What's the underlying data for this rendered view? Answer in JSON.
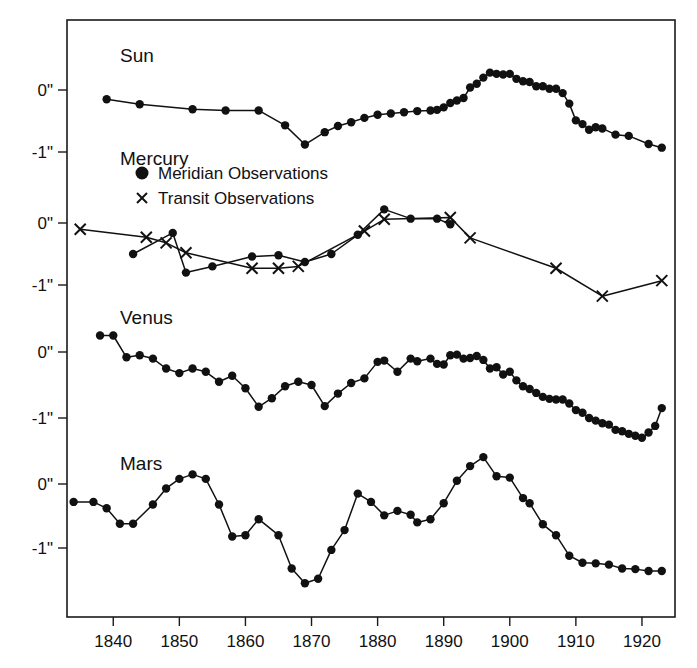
{
  "chart_data": {
    "type": "line",
    "title": "",
    "xlabel": "",
    "ylabel": "",
    "xlim": [
      1833,
      1925
    ],
    "grid": false,
    "legend_position": "inside-upper-left",
    "x_ticks": [
      1840,
      1850,
      1860,
      1870,
      1880,
      1890,
      1900,
      1910,
      1920
    ],
    "x_tick_labels": [
      "1840",
      "1850",
      "1860",
      "1870",
      "1880",
      "1890",
      "1900",
      "1910",
      "1920"
    ],
    "y_tick_labels": [
      "0\"",
      "-1\""
    ],
    "y_tick_values": [
      0,
      -1
    ],
    "legend": [
      {
        "label": "Meridian Observations",
        "marker": "filled-circle"
      },
      {
        "label": "Transit Observations",
        "marker": "cross-x"
      }
    ],
    "panels": [
      {
        "name": "Sun",
        "label": "Sun",
        "ylim": [
          -1.45,
          0.5
        ],
        "series": [
          {
            "name": "Sun meridian",
            "marker": "filled-circle",
            "x": [
              1839,
              1844,
              1852,
              1857,
              1862,
              1866,
              1869,
              1872,
              1874,
              1876,
              1878,
              1880,
              1882,
              1884,
              1886,
              1888,
              1889,
              1890,
              1891,
              1892,
              1893,
              1894,
              1895,
              1896,
              1897,
              1898,
              1899,
              1900,
              1901,
              1902,
              1903,
              1904,
              1905,
              1906,
              1907,
              1908,
              1909,
              1910,
              1911,
              1912,
              1913,
              1914,
              1916,
              1918,
              1921,
              1923
            ],
            "y": [
              -0.15,
              -0.23,
              -0.31,
              -0.33,
              -0.33,
              -0.57,
              -0.88,
              -0.68,
              -0.58,
              -0.52,
              -0.45,
              -0.4,
              -0.38,
              -0.36,
              -0.34,
              -0.33,
              -0.32,
              -0.28,
              -0.21,
              -0.17,
              -0.13,
              0.04,
              0.1,
              0.2,
              0.28,
              0.26,
              0.25,
              0.26,
              0.18,
              0.14,
              0.13,
              0.06,
              0.06,
              0.02,
              0.02,
              -0.05,
              -0.22,
              -0.49,
              -0.55,
              -0.64,
              -0.6,
              -0.62,
              -0.72,
              -0.74,
              -0.87,
              -0.93,
              -0.97,
              -1.02
            ]
          }
        ]
      },
      {
        "name": "Mercury",
        "label": "Mercury",
        "ylim": [
          -1.45,
          0.55
        ],
        "series": [
          {
            "name": "Mercury meridian",
            "marker": "filled-circle",
            "x": [
              1843,
              1849,
              1851,
              1855,
              1861,
              1865,
              1869,
              1873,
              1877,
              1881,
              1885,
              1889,
              1891
            ],
            "y": [
              -0.5,
              -0.16,
              -0.8,
              -0.7,
              -0.54,
              -0.52,
              -0.63,
              -0.5,
              -0.19,
              0.22,
              0.07,
              0.07,
              -0.02
            ]
          },
          {
            "name": "Mercury transit",
            "marker": "cross-x",
            "x": [
              1835,
              1845,
              1848,
              1851,
              1861,
              1865,
              1868,
              1878,
              1881,
              1891,
              1894,
              1907,
              1914,
              1923
            ],
            "y": [
              -0.1,
              -0.23,
              -0.32,
              -0.48,
              -0.73,
              -0.73,
              -0.7,
              -0.13,
              0.06,
              0.09,
              -0.24,
              -0.73,
              -1.18,
              -0.93
            ]
          }
        ]
      },
      {
        "name": "Venus",
        "label": "Venus",
        "ylim": [
          -1.55,
          0.5
        ],
        "series": [
          {
            "name": "Venus meridian",
            "marker": "filled-circle",
            "x": [
              1838,
              1840,
              1842,
              1844,
              1846,
              1848,
              1850,
              1852,
              1854,
              1856,
              1858,
              1860,
              1862,
              1864,
              1866,
              1868,
              1870,
              1872,
              1874,
              1876,
              1878,
              1880,
              1881,
              1883,
              1885,
              1886,
              1888,
              1889,
              1890,
              1891,
              1892,
              1893,
              1894,
              1895,
              1896,
              1897,
              1898,
              1899,
              1900,
              1901,
              1902,
              1903,
              1904,
              1905,
              1906,
              1907,
              1908,
              1909,
              1910,
              1911,
              1912,
              1913,
              1914,
              1915,
              1916,
              1917,
              1918,
              1919,
              1920,
              1921,
              1922,
              1923
            ],
            "y": [
              0.25,
              0.25,
              -0.08,
              -0.05,
              -0.1,
              -0.25,
              -0.32,
              -0.25,
              -0.3,
              -0.45,
              -0.36,
              -0.55,
              -0.83,
              -0.7,
              -0.52,
              -0.45,
              -0.5,
              -0.82,
              -0.63,
              -0.47,
              -0.4,
              -0.15,
              -0.13,
              -0.3,
              -0.1,
              -0.14,
              -0.1,
              -0.18,
              -0.19,
              -0.05,
              -0.04,
              -0.1,
              -0.09,
              -0.06,
              -0.12,
              -0.25,
              -0.23,
              -0.34,
              -0.3,
              -0.43,
              -0.52,
              -0.56,
              -0.62,
              -0.68,
              -0.71,
              -0.72,
              -0.72,
              -0.78,
              -0.88,
              -0.92,
              -1.0,
              -1.04,
              -1.08,
              -1.1,
              -1.18,
              -1.2,
              -1.24,
              -1.27,
              -1.3,
              -1.22,
              -1.12,
              -0.85
            ]
          }
        ]
      },
      {
        "name": "Mars",
        "label": "Mars",
        "ylim": [
          -1.75,
          0.5
        ],
        "series": [
          {
            "name": "Mars meridian",
            "marker": "filled-circle",
            "x": [
              1834,
              1837,
              1839,
              1841,
              1843,
              1846,
              1848,
              1850,
              1852,
              1854,
              1856,
              1858,
              1860,
              1862,
              1865,
              1867,
              1869,
              1871,
              1873,
              1875,
              1877,
              1879,
              1881,
              1883,
              1885,
              1886,
              1888,
              1890,
              1892,
              1894,
              1896,
              1898,
              1900,
              1902,
              1903,
              1905,
              1907,
              1909,
              1911,
              1913,
              1915,
              1917,
              1919,
              1921,
              1923
            ],
            "y": [
              -0.28,
              -0.28,
              -0.38,
              -0.62,
              -0.62,
              -0.32,
              -0.07,
              0.08,
              0.15,
              0.08,
              -0.32,
              -0.82,
              -0.8,
              -0.55,
              -0.8,
              -1.32,
              -1.55,
              -1.48,
              -1.03,
              -0.72,
              -0.15,
              -0.28,
              -0.49,
              -0.42,
              -0.48,
              -0.6,
              -0.55,
              -0.3,
              0.05,
              0.28,
              0.42,
              0.12,
              0.1,
              -0.22,
              -0.3,
              -0.63,
              -0.8,
              -1.12,
              -1.23,
              -1.24,
              -1.26,
              -1.32,
              -1.33,
              -1.36,
              -1.36
            ]
          }
        ]
      }
    ]
  },
  "panel_titles": {
    "sun": "Sun",
    "mercury": "Mercury",
    "venus": "Venus",
    "mars": "Mars"
  },
  "legend_labels": {
    "meridian": "Meridian Observations",
    "transit": "Transit Observations"
  }
}
